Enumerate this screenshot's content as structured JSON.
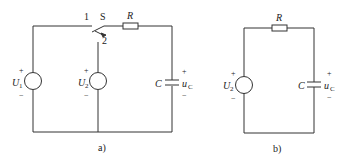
{
  "figure_a": {
    "caption": "a)",
    "switch_label": "S",
    "switch_pos1": "1",
    "switch_pos2": "2",
    "resistor_label": "R",
    "source1": {
      "name": "U",
      "sub": "1",
      "plus": "+",
      "minus": "−"
    },
    "source2": {
      "name": "U",
      "sub": "2",
      "plus": "+",
      "minus": "−"
    },
    "capacitor_label": "C",
    "voltage": {
      "name": "u",
      "sub": "C",
      "plus": "+",
      "minus": "−"
    }
  },
  "figure_b": {
    "caption": "b)",
    "resistor_label": "R",
    "source": {
      "name": "U",
      "sub": "2",
      "plus": "+",
      "minus": "−"
    },
    "capacitor_label": "C",
    "voltage": {
      "name": "u",
      "sub": "C",
      "plus": "+",
      "minus": "−"
    }
  }
}
